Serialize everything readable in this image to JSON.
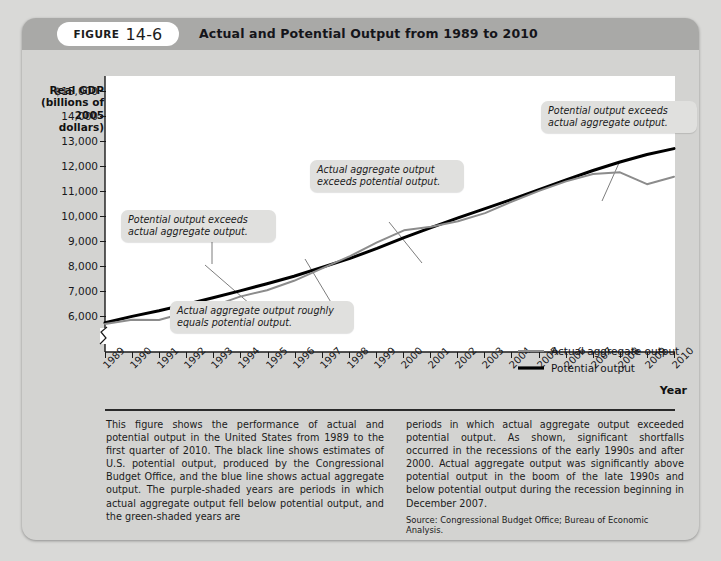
{
  "figure": {
    "label_word": "FIGURE",
    "number": "14-6",
    "title": "Actual and Potential Output from 1989 to 2010"
  },
  "axes": {
    "y_title": "Real GDP\n(billions of\n2005 dollars)",
    "y_title_lines": [
      "Real GDP",
      "(billions of",
      "2005 dollars)"
    ],
    "x_title": "Year",
    "y_ticks": [
      "$15,000",
      "14,000",
      "13,000",
      "12,000",
      "11,000",
      "10,000",
      "9,000",
      "8,000",
      "7,000",
      "6,000"
    ],
    "x_ticks": [
      "1989",
      "1990",
      "1991",
      "1992",
      "1993",
      "1994",
      "1995",
      "1996",
      "1997",
      "1998",
      "1999",
      "2000",
      "2001",
      "2002",
      "2003",
      "2004",
      "2005",
      "2006",
      "2007",
      "2008",
      "2009",
      "2010"
    ],
    "axis_break": true
  },
  "legend": {
    "position": "inside-bottom-right",
    "items": [
      {
        "label": "Actual aggregate output",
        "color": "#8c8c8c",
        "width": 2
      },
      {
        "label": "Potential output",
        "color": "#000000",
        "width": 3.2
      }
    ]
  },
  "annotations": [
    {
      "id": "annot-potential-exceeds-left",
      "text": "Potential output exceeds\nactual aggregate output."
    },
    {
      "id": "annot-roughly-equal",
      "text": "Actual aggregate output roughly\nequals potential output."
    },
    {
      "id": "annot-actual-exceeds",
      "text": "Actual aggregate output\nexceeds potential output."
    },
    {
      "id": "annot-potential-exceeds-right",
      "text": "Potential output exceeds\nactual aggregate output."
    }
  ],
  "caption": {
    "left": "This figure shows the performance of actual and potential output in the United States from 1989 to the first quarter of 2010. The black line shows estimates of U.S. potential output, produced by the Congressional Budget Office, and the blue line shows actual aggregate output. The purple-shaded years are periods in which actual aggregate output fell below potential output, and the green-shaded years are",
    "right": "periods in which actual aggregate output exceeded potential output. As shown, significant shortfalls occurred in the recessions of the early 1990s and after 2000. Actual aggregate output was significantly above potential output in the boom of the late 1990s and below potential output during the recession beginning in December 2007.",
    "source": "Source: Congressional Budget Office; Bureau of Economic Analysis."
  },
  "colors": {
    "page_background": "#d9d9d7",
    "card_background": "#d3d3d1",
    "header_bar": "#a9a9a7",
    "plot_background": "#ffffff",
    "actual_line": "#8c8c8c",
    "potential_line": "#000000",
    "annotation_background": "#e0e0de"
  },
  "chart_data": {
    "type": "line",
    "title": "Actual and Potential Output from 1989 to 2010",
    "xlabel": "Year",
    "ylabel": "Real GDP (billions of 2005 dollars)",
    "ylim": [
      5500,
      15500
    ],
    "yticks": [
      6000,
      7000,
      8000,
      9000,
      10000,
      11000,
      12000,
      13000,
      14000,
      15000
    ],
    "axis_break_below": 6000,
    "grid": false,
    "legend_position": "lower right",
    "x": [
      1989,
      1990,
      1991,
      1992,
      1993,
      1994,
      1995,
      1996,
      1997,
      1998,
      1999,
      2000,
      2001,
      2002,
      2003,
      2004,
      2005,
      2006,
      2007,
      2008,
      2009,
      2010
    ],
    "series": [
      {
        "name": "Actual aggregate output",
        "color": "#8c8c8c",
        "values": [
          7840,
          7990,
          7980,
          8250,
          8480,
          8820,
          9050,
          9390,
          9820,
          10280,
          10780,
          11220,
          11350,
          11550,
          11840,
          12260,
          12640,
          12980,
          13250,
          13310,
          12880,
          13150
        ]
      },
      {
        "name": "Potential output",
        "color": "#000000",
        "values": [
          7800,
          8030,
          8230,
          8460,
          8700,
          8950,
          9210,
          9480,
          9790,
          10120,
          10480,
          10870,
          11230,
          11580,
          11910,
          12250,
          12600,
          12950,
          13290,
          13600,
          13870,
          14080
        ]
      }
    ],
    "annotations": [
      {
        "text": "Potential output exceeds actual aggregate output.",
        "points_to_year": 1992
      },
      {
        "text": "Actual aggregate output roughly equals potential output.",
        "points_to_year": 1995
      },
      {
        "text": "Actual aggregate output exceeds potential output.",
        "points_to_year": 2000
      },
      {
        "text": "Potential output exceeds actual aggregate output.",
        "points_to_year": 2009
      }
    ]
  }
}
